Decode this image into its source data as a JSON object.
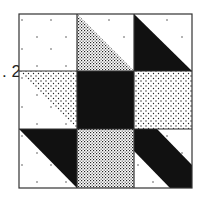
{
  "figure": {
    "label": ". 2",
    "grid": {
      "rows": 3,
      "cols": 3
    },
    "colors": {
      "black": "#111111",
      "white": "#ffffff",
      "border": "#333333"
    },
    "cells": [
      {
        "row": 0,
        "col": 0,
        "type": "solid",
        "fill": "white-dotted"
      },
      {
        "row": 0,
        "col": 1,
        "type": "half-square-triangle",
        "upper_right": "white-dotted",
        "lower_left": "fine-stipple"
      },
      {
        "row": 0,
        "col": 2,
        "type": "half-square-triangle",
        "upper_right": "white-dotted",
        "lower_left": "black"
      },
      {
        "row": 1,
        "col": 0,
        "type": "half-square-triangle",
        "upper_right": "coarse-stipple",
        "lower_left": "white-dotted"
      },
      {
        "row": 1,
        "col": 1,
        "type": "solid",
        "fill": "black"
      },
      {
        "row": 1,
        "col": 2,
        "type": "solid",
        "fill": "coarse-stipple"
      },
      {
        "row": 2,
        "col": 0,
        "type": "half-square-triangle",
        "upper_right": "black",
        "lower_left": "white-dotted"
      },
      {
        "row": 2,
        "col": 1,
        "type": "solid",
        "fill": "fine-stipple"
      },
      {
        "row": 2,
        "col": 2,
        "type": "diagonal-band",
        "band": "black",
        "corners": "white-dotted"
      }
    ]
  }
}
